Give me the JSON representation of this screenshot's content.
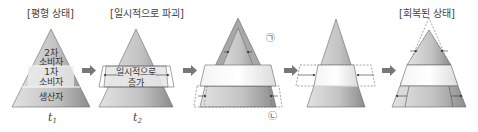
{
  "titles": {
    "equilibrium": "[평형 상태]",
    "disruption": "[일시적으로 파괴]",
    "recovered": "[회복된 상태]"
  },
  "pyramid1": {
    "levels": [
      "2차\n소비자",
      "1차\n소비자",
      "생산자"
    ],
    "level_top_line1": "2차",
    "level_top_line2": "소비자",
    "level_mid_line1": "1차",
    "level_mid_line2": "소비자",
    "level_bottom": "생산자",
    "time_label": "t",
    "time_sub": "1"
  },
  "pyramid2": {
    "middle_line1": "일시적으로",
    "middle_line2": "증가",
    "time_label": "t",
    "time_sub": "2"
  },
  "pyramid3": {
    "marker_top": "㉠",
    "marker_bottom": "㉡"
  },
  "colors": {
    "pyramid_dark": "#8a8a8a",
    "pyramid_light": "#d6d6d6",
    "band_light": "#f2f2f2",
    "arrow": "#7a7a7a",
    "stroke": "#555555"
  }
}
